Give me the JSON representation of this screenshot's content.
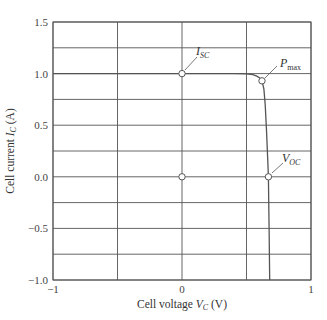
{
  "chart_data": {
    "type": "line",
    "title": "",
    "xlabel": "Cell voltage V_C (V)",
    "ylabel": "Cell current I_C (A)",
    "xlim": [
      -1,
      1
    ],
    "ylim": [
      -1.0,
      1.5
    ],
    "x_ticks": [
      "−1",
      "0",
      "1"
    ],
    "y_ticks": [
      "1.5",
      "1.0",
      "0.5",
      "0.0",
      "−0.5",
      "−1.0"
    ],
    "grid": true,
    "grid_x": [
      -1,
      -0.5,
      0,
      0.5,
      1
    ],
    "grid_y": [
      -1.0,
      -0.75,
      -0.5,
      -0.25,
      0,
      0.25,
      0.5,
      0.75,
      1.0,
      1.25,
      1.5
    ],
    "series": [
      {
        "name": "I-V curve",
        "x": [
          -1.0,
          0.0,
          0.4,
          0.5,
          0.55,
          0.58,
          0.6,
          0.62,
          0.635,
          0.645,
          0.655,
          0.665,
          0.67,
          0.675,
          0.68
        ],
        "y": [
          1.0,
          1.0,
          1.0,
          0.998,
          0.99,
          0.975,
          0.96,
          0.93,
          0.85,
          0.7,
          0.45,
          0.15,
          0.0,
          -0.5,
          -1.0
        ]
      }
    ],
    "points": [
      {
        "label": "I_SC",
        "x": 0.0,
        "y": 1.0
      },
      {
        "label": "P_max",
        "x": 0.62,
        "y": 0.93
      },
      {
        "label": "V_OC",
        "x": 0.67,
        "y": 0.0
      },
      {
        "label": "",
        "x": 0.0,
        "y": 0.0
      }
    ],
    "annotations": [
      {
        "text": "I",
        "sub": "SC"
      },
      {
        "text": "P",
        "sub": "max"
      },
      {
        "text": "V",
        "sub": "OC"
      }
    ]
  },
  "labels": {
    "xlabel_main": "Cell voltage ",
    "xlabel_var": "V",
    "xlabel_sub": "C",
    "xlabel_unit": " (V)",
    "ylabel_main": "Cell current ",
    "ylabel_var": "I",
    "ylabel_sub": "C",
    "ylabel_unit": " (A)",
    "isc_var": "I",
    "isc_sub": "SC",
    "pmax_var": "P",
    "pmax_sub": "max",
    "voc_var": "V",
    "voc_sub": "OC"
  },
  "ticks": {
    "x": [
      "−1",
      "0",
      "1"
    ],
    "y": [
      "1.5",
      "1.0",
      "0.5",
      "0.0",
      "−0.5",
      "−1.0"
    ]
  }
}
